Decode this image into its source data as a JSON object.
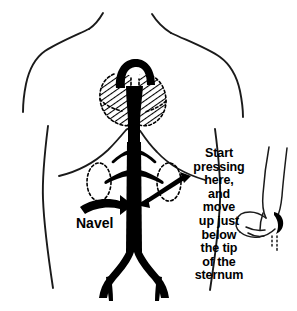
{
  "figure": {
    "colors": {
      "ink": "#000000",
      "outline": "#1a1a1a",
      "background": "#ffffff"
    }
  },
  "labels": {
    "navel": "Navel",
    "instruction_lines": [
      "Start",
      "pressing",
      "here,",
      "and",
      "move",
      "up just",
      "below",
      "the tip",
      "of the",
      "sternum"
    ]
  },
  "anatomy": [
    {
      "name": "torso-outline",
      "description": "Shoulders, neck and trunk silhouette"
    },
    {
      "name": "ribcage-outline",
      "description": "Inverted V of the lower rib margin and diaphragm"
    },
    {
      "name": "heart-region",
      "description": "Dotted outline with diagonal hatching representing the heart behind the sternum"
    },
    {
      "name": "aortic-arch",
      "description": "Thick black arch at the top of the aorta"
    },
    {
      "name": "aorta",
      "description": "Thick black descending abdominal aorta"
    },
    {
      "name": "renal-arteries",
      "description": "Paired branches running to each kidney"
    },
    {
      "name": "iliac-arteries",
      "description": "Bifurcation of the aorta into the left and right iliac arteries"
    },
    {
      "name": "kidney-left",
      "description": "Dashed oval outline of the left kidney"
    },
    {
      "name": "kidney-right",
      "description": "Dashed oval outline of the right kidney"
    },
    {
      "name": "hand-fist",
      "description": "Line drawing of a closed fist and forearm at the right of the figure"
    }
  ],
  "annotations": [
    {
      "name": "navel-arrow",
      "description": "Curved solid arrow pointing right from the Navel label toward the aorta"
    },
    {
      "name": "instruction-pointer-arrow",
      "description": "Tapered arrow pointing left and down from the instruction text to the aorta"
    }
  ]
}
